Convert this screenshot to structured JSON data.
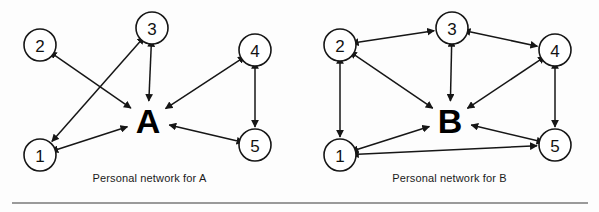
{
  "figure": {
    "width": 599,
    "height": 212,
    "background_color": "#fdfdfd",
    "rule_color": "#9a9a9a",
    "node_fill": "#ffffff",
    "stroke_color": "#161616"
  },
  "panels": [
    {
      "id": "panel-a",
      "caption": "Personal network for A",
      "hub": {
        "label": "A",
        "x": 148,
        "y": 120
      },
      "nodes": [
        {
          "label": "2",
          "x": 40,
          "y": 45,
          "r": 16
        },
        {
          "label": "3",
          "x": 152,
          "y": 28,
          "r": 16
        },
        {
          "label": "4",
          "x": 255,
          "y": 50,
          "r": 16
        },
        {
          "label": "1",
          "x": 40,
          "y": 155,
          "r": 16
        },
        {
          "label": "5",
          "x": 255,
          "y": 145,
          "r": 16
        }
      ],
      "edges": [
        {
          "from": "2",
          "to": "A",
          "direction": "both"
        },
        {
          "from": "3",
          "to": "A",
          "direction": "both"
        },
        {
          "from": "3",
          "to": "1",
          "direction": "both"
        },
        {
          "from": "4",
          "to": "A",
          "direction": "both"
        },
        {
          "from": "4",
          "to": "5",
          "direction": "both"
        },
        {
          "from": "5",
          "to": "A",
          "direction": "both"
        },
        {
          "from": "1",
          "to": "A",
          "direction": "both"
        }
      ]
    },
    {
      "id": "panel-b",
      "caption": "Personal network for B",
      "hub": {
        "label": "B",
        "x": 150,
        "y": 120
      },
      "nodes": [
        {
          "label": "2",
          "x": 40,
          "y": 45,
          "r": 16
        },
        {
          "label": "3",
          "x": 152,
          "y": 28,
          "r": 16
        },
        {
          "label": "4",
          "x": 255,
          "y": 50,
          "r": 16
        },
        {
          "label": "1",
          "x": 40,
          "y": 155,
          "r": 16
        },
        {
          "label": "5",
          "x": 255,
          "y": 145,
          "r": 16
        }
      ],
      "edges": [
        {
          "from": "2",
          "to": "3",
          "direction": "both"
        },
        {
          "from": "3",
          "to": "4",
          "direction": "both"
        },
        {
          "from": "2",
          "to": "B",
          "direction": "both"
        },
        {
          "from": "3",
          "to": "B",
          "direction": "both"
        },
        {
          "from": "4",
          "to": "B",
          "direction": "both"
        },
        {
          "from": "1",
          "to": "B",
          "direction": "both"
        },
        {
          "from": "5",
          "to": "B",
          "direction": "both"
        },
        {
          "from": "2",
          "to": "1",
          "direction": "both"
        },
        {
          "from": "4",
          "to": "5",
          "direction": "both"
        },
        {
          "from": "1",
          "to": "5",
          "direction": "both"
        }
      ]
    }
  ]
}
